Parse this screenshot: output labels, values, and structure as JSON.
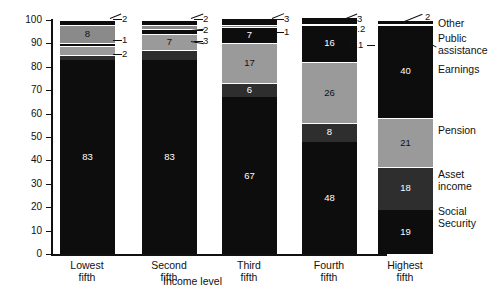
{
  "chart_data": {
    "type": "bar",
    "subtype": "stacked-bar-100",
    "title": "",
    "xlabel": "Income level",
    "ylabel": "Percent",
    "ylim": [
      0,
      100
    ],
    "ytick_labels": [
      "0",
      "10",
      "20",
      "30",
      "40",
      "50",
      "60",
      "70",
      "80",
      "90",
      "100"
    ],
    "yticks": [
      0,
      10,
      20,
      30,
      40,
      50,
      60,
      70,
      80,
      90,
      100
    ],
    "grid": false,
    "legend_position": "right",
    "categories": [
      "Lowest fifth",
      "Second fifth",
      "Third fifth",
      "Fourth fifth",
      "Highest fifth"
    ],
    "category_lines": [
      [
        "Lowest",
        "fifth"
      ],
      [
        "Second",
        "fifth"
      ],
      [
        "Third",
        "fifth"
      ],
      [
        "Fourth",
        "fifth"
      ],
      [
        "Highest",
        "fifth"
      ]
    ],
    "series": [
      {
        "name": "Social Security",
        "color": "#0d0d0d",
        "values": [
          83,
          83,
          67,
          48,
          19
        ],
        "labels": [
          "83",
          "83",
          "67",
          "48",
          "19"
        ]
      },
      {
        "name": "Asset income",
        "color": "#2e2e2e",
        "values": [
          2,
          4,
          6,
          8,
          18
        ],
        "labels": [
          "2",
          "4",
          "6",
          "8",
          "18"
        ]
      },
      {
        "name": "Pension",
        "color": "#9a9a9a",
        "values": [
          4,
          7,
          17,
          26,
          21
        ],
        "labels": [
          "4",
          "7",
          "17",
          "26",
          "21"
        ]
      },
      {
        "name": "Earnings",
        "color": "#0d0d0d",
        "values": [
          1,
          2,
          7,
          16,
          40
        ],
        "labels": [
          "1",
          "2",
          "7",
          "16",
          "40"
        ]
      },
      {
        "name": "Public assistance",
        "color": "#8a8a8a",
        "values": [
          8,
          2,
          1,
          0.2,
          0.1
        ],
        "labels": [
          "8",
          "2",
          "1",
          "0.2",
          "0.1"
        ]
      },
      {
        "name": "Other",
        "color": "#0d0d0d",
        "values": [
          2,
          2,
          3,
          3,
          2
        ],
        "labels": [
          "2",
          "2",
          "3",
          "3",
          "2"
        ]
      }
    ],
    "legend_entries": [
      {
        "name": "Other",
        "lines": [
          "Other"
        ]
      },
      {
        "name": "Public assistance",
        "lines": [
          "Public",
          "assistance"
        ]
      },
      {
        "name": "Earnings",
        "lines": [
          "Earnings"
        ]
      },
      {
        "name": "Pension",
        "lines": [
          "Pension"
        ]
      },
      {
        "name": "Asset income",
        "lines": [
          "Asset",
          "income"
        ]
      },
      {
        "name": "Social Security",
        "lines": [
          "Social",
          "Security"
        ]
      }
    ],
    "callouts": [
      {
        "id": "c1",
        "text": "2"
      },
      {
        "id": "c2",
        "text": "1"
      },
      {
        "id": "c3",
        "text": "2"
      },
      {
        "id": "c4",
        "text": "2"
      },
      {
        "id": "c5",
        "text": "2"
      },
      {
        "id": "c6",
        "text": "3"
      },
      {
        "id": "c7",
        "text": "3"
      },
      {
        "id": "c8",
        "text": "1"
      },
      {
        "id": "c9",
        "text": "3"
      },
      {
        "id": "c10",
        "text": "0.2"
      },
      {
        "id": "c11",
        "text": "0.1"
      },
      {
        "id": "c12",
        "text": "2"
      }
    ]
  }
}
